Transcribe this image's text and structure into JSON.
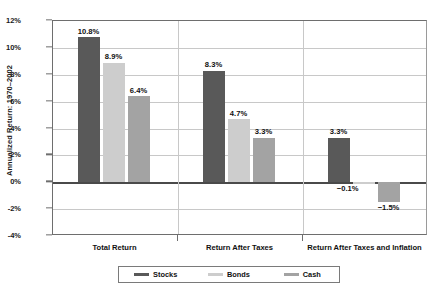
{
  "chart_data": {
    "type": "bar",
    "title": "",
    "xlabel": "",
    "ylabel": "Annualized Return: 1970–2002",
    "ylim": [
      -4,
      12
    ],
    "ytick_labels": [
      "12%",
      "10%",
      "8%",
      "6%",
      "4%",
      "2%",
      "0%",
      "-2%",
      "-4%"
    ],
    "ytick_values": [
      12,
      10,
      8,
      6,
      4,
      2,
      0,
      -2,
      -4
    ],
    "grid": true,
    "legend_position": "bottom",
    "categories": [
      "Total Return",
      "Return After Taxes",
      "Return After Taxes and Inflation"
    ],
    "series": [
      {
        "name": "Stocks",
        "color": "#595959",
        "values": [
          10.8,
          8.3,
          3.3
        ],
        "labels": [
          "10.8%",
          "8.3%",
          "3.3%"
        ]
      },
      {
        "name": "Bonds",
        "color": "#cdcdcd",
        "values": [
          8.9,
          4.7,
          -0.1
        ],
        "labels": [
          "8.9%",
          "4.7%",
          "−0.1%"
        ]
      },
      {
        "name": "Cash",
        "color": "#a3a3a3",
        "values": [
          6.4,
          3.3,
          -1.5
        ],
        "labels": [
          "6.4%",
          "3.3%",
          "−1.5%"
        ]
      }
    ]
  },
  "legend": {
    "items": [
      {
        "label": "Stocks",
        "color": "#595959"
      },
      {
        "label": "Bonds",
        "color": "#cdcdcd"
      },
      {
        "label": "Cash",
        "color": "#a3a3a3"
      }
    ]
  }
}
